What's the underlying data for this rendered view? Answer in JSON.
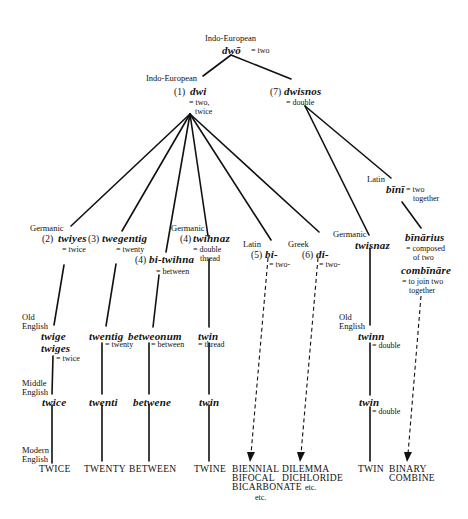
{
  "root": {
    "label": "Indo-European",
    "word": "dwō",
    "gloss": "= two"
  },
  "n1": {
    "label": "Indo-European",
    "num": "(1)",
    "word": "dwi",
    "gloss1": "= two,",
    "gloss2": "twice"
  },
  "n7": {
    "num": "(7)",
    "word": "dwisnos",
    "gloss": "= double"
  },
  "n2": {
    "label": "Germanic",
    "num": "(2)",
    "word": "twiyes",
    "gloss": "= twice"
  },
  "n3": {
    "num": "(3)",
    "word": "twegentig",
    "gloss": "= twenty"
  },
  "n4a": {
    "num": "(4)",
    "word": "bi-twihna",
    "gloss": "= between"
  },
  "n4b": {
    "label": "Germanic",
    "num": "(4)",
    "word": "twihnaz",
    "gloss1": "= double",
    "gloss2": "thread"
  },
  "n5": {
    "label": "Latin",
    "num": "(5)",
    "word": "bi-",
    "gloss": "= two-"
  },
  "n6": {
    "label": "Greek",
    "num": "(6)",
    "word": "di-",
    "gloss": "= two-"
  },
  "n7a": {
    "label": "Germanic",
    "word": "twisnaz"
  },
  "n7b": {
    "label": "Latin",
    "word": "bīnī",
    "gloss1": "= two",
    "gloss2": "together"
  },
  "n7c": {
    "word": "bīnārius",
    "gloss1": "= composed",
    "gloss2": "of two",
    "word2": "combīnāre",
    "gloss3": "= to join two",
    "gloss4": "together"
  },
  "periods": {
    "old_english_1": "Old",
    "old_english_2": "English",
    "middle_english_1": "Middle",
    "middle_english_2": "English",
    "modern_english_1": "Modern",
    "modern_english_2": "English"
  },
  "old_english": {
    "twige": "twige",
    "twiges": "twiges",
    "twiges_gloss": "= twice",
    "twentig": "twentig",
    "twentig_gloss": "= twenty",
    "betweonum": "betweonum",
    "betweonum_gloss": "= between",
    "twin": "twin",
    "twin_gloss": "= thread",
    "twinn": "twinn",
    "twinn_gloss": "= double"
  },
  "middle_english": {
    "twice": "twice",
    "twenti": "twenti",
    "betwene": "betwene",
    "twin": "twin",
    "twin2": "twin",
    "twin2_gloss": "= double"
  },
  "modern": {
    "twice": "TWICE",
    "twenty": "TWENTY",
    "between": "BETWEEN",
    "twine": "TWINE",
    "bi1": "BIENNIAL",
    "bi2": "BIFOCAL",
    "bi3": "BICARBONATE",
    "bi_etc": "etc.",
    "di1": "DILEMMA",
    "di2": "DICHLORIDE",
    "di_etc": "etc.",
    "twin": "TWIN",
    "bin1": "BINARY",
    "bin2": "COMBINE"
  }
}
